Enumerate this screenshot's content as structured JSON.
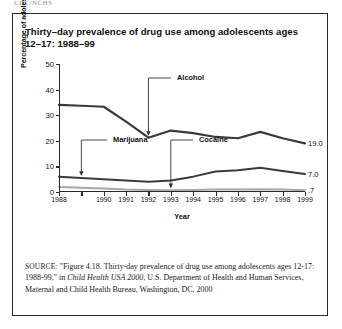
{
  "page_header": "CDC/NCHS",
  "figure": {
    "title": "Thirty–day prevalence of drug use among adolescents ages 12–17: 1988–99",
    "source_prefix": "SOURCE:",
    "source_part1": " \"Figure 4.18. Thirty-day prevalence of drug use among adolescents ages 12-17: 1988-99,\" in ",
    "source_italic": "Child Health USA 2000",
    "source_part2": ", U.S. Department of Health and Human Services, Maternal and Child Health Bureau, Washington, DC, 2000"
  },
  "chart_data": {
    "type": "line",
    "title": "Thirty–day prevalence of drug use among adolescents ages 12–17: 1988–99",
    "xlabel": "Year",
    "ylabel": "Percentage of adolescents ages 12–17",
    "xlim": [
      1988,
      1999
    ],
    "ylim": [
      0,
      50
    ],
    "yticks": [
      0,
      10,
      20,
      30,
      40,
      50
    ],
    "ytick_labels": [
      "0",
      "10",
      "20",
      "30",
      "40",
      "50"
    ],
    "x": [
      1988,
      1989,
      1990,
      1991,
      1992,
      1993,
      1994,
      1995,
      1996,
      1997,
      1998,
      1999
    ],
    "xtick_labels": [
      "1988",
      "",
      "1990",
      "1991",
      "1992",
      "1993",
      "1994",
      "1995",
      "1996",
      "1997",
      "1998",
      "1999"
    ],
    "grid": false,
    "legend": "none",
    "series": [
      {
        "name": "Alcohol",
        "color": "#3a3a3a",
        "width": 2.2,
        "values": [
          34.0,
          33.7,
          33.3,
          27.5,
          21.2,
          24.0,
          23.0,
          21.5,
          21.0,
          23.5,
          21.0,
          19.0
        ],
        "end_label": "19.0"
      },
      {
        "name": "Marijuana",
        "color": "#3a3a3a",
        "width": 2.0,
        "values": [
          6.0,
          5.5,
          5.0,
          4.5,
          4.0,
          4.5,
          6.0,
          8.0,
          8.5,
          9.5,
          8.2,
          7.0
        ],
        "end_label": "7.0"
      },
      {
        "name": "Cocaine",
        "color": "#a8a8a8",
        "width": 2.0,
        "values": [
          2.0,
          1.7,
          1.4,
          1.0,
          0.8,
          0.7,
          0.8,
          1.0,
          1.0,
          1.1,
          1.0,
          0.7
        ],
        "end_label": ".7"
      }
    ],
    "annotations": [
      {
        "label": "Alcohol",
        "points_to_year": 1992,
        "points_to_value": 21.2
      },
      {
        "label": "Marijuana",
        "points_to_year": 1989,
        "points_to_value": 5.5
      },
      {
        "label": "Cocaine",
        "points_to_year": 1993,
        "points_to_value": 0.7
      }
    ]
  }
}
